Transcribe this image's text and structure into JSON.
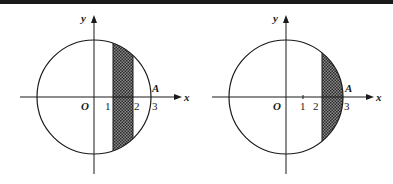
{
  "figures": [
    {
      "id": "left",
      "axis_labels": {
        "x": "x",
        "y": "y"
      },
      "origin_label": "O",
      "point_label": "A",
      "ticks": [
        "1",
        "2",
        "3"
      ],
      "circle_radius": 3,
      "shaded_region": {
        "from_x": 1,
        "to_x": 2,
        "description": "vertical strip of disk between x=1 and x=2"
      }
    },
    {
      "id": "right",
      "axis_labels": {
        "x": "x",
        "y": "y"
      },
      "origin_label": "O",
      "point_label": "A",
      "ticks": [
        "1",
        "2",
        "3"
      ],
      "circle_radius": 3,
      "shaded_region": {
        "from_x": 2,
        "to_x": 3,
        "description": "circular segment of disk to the right of x=2"
      }
    }
  ],
  "colors": {
    "line": "#1a1a1a",
    "fill": "#555555",
    "background": "#ffffff"
  }
}
